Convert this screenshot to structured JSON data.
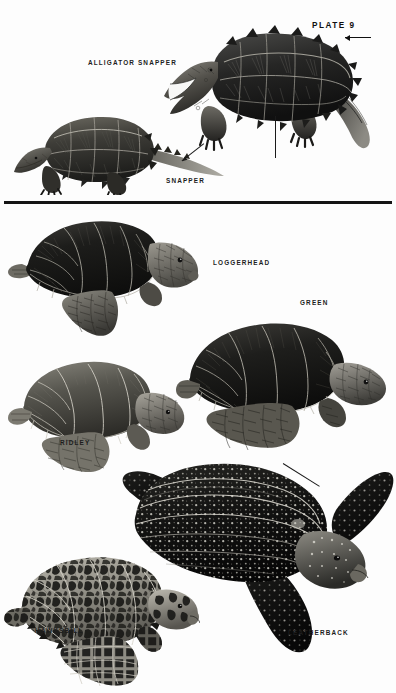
{
  "plate": {
    "number_label": "PLATE 9",
    "background_color": "#fdfdfd",
    "ink_color": "#141414",
    "width": 396,
    "height": 693
  },
  "sections": [
    {
      "name": "snapping-turtles",
      "figures": [
        {
          "id": "alligator-snapper",
          "label": "ALLIGATOR SNAPPER"
        },
        {
          "id": "snapper",
          "label": "SNAPPER"
        }
      ]
    },
    {
      "name": "sea-turtles",
      "figures": [
        {
          "id": "loggerhead",
          "label": "LOGGERHEAD"
        },
        {
          "id": "green",
          "label": "GREEN"
        },
        {
          "id": "ridley",
          "label": "RIDLEY"
        },
        {
          "id": "leatherback",
          "label": "LEATHERBACK"
        },
        {
          "id": "hawksbill",
          "label": "HAWKSBILL"
        }
      ]
    }
  ],
  "labels": {
    "plate_number": "PLATE 9",
    "alligator_snapper": "ALLIGATOR SNAPPER",
    "snapper": "SNAPPER",
    "loggerhead": "LOGGERHEAD",
    "green": "GREEN",
    "ridley": "RIDLEY",
    "leatherback": "LEATHERBACK",
    "hawksbill": "HAWKSBILL"
  }
}
